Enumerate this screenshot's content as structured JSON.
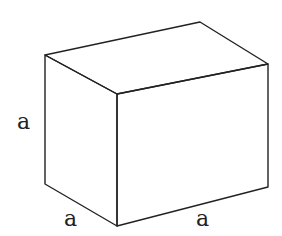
{
  "figure": {
    "type": "rectangular-prism",
    "stroke_color": "#222222",
    "background": "#ffffff",
    "labels": {
      "height": "a",
      "depth": "a",
      "width": "a"
    },
    "vertices": {
      "back_top_left": [
        45,
        55
      ],
      "back_top_right": [
        200,
        22
      ],
      "front_top_left": [
        117,
        94
      ],
      "front_top_right": [
        268,
        64
      ],
      "front_bottom_left": [
        117,
        226
      ],
      "front_bottom_right": [
        268,
        187
      ],
      "back_bottom_left": [
        45,
        184
      ]
    }
  }
}
